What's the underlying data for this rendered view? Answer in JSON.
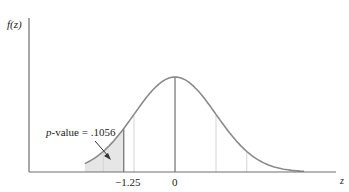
{
  "chart_data": {
    "type": "area",
    "title": "",
    "ylabel": "f(z)",
    "xlabel": "z",
    "distribution": "standard normal",
    "tick_labels": [
      "-1.25",
      "0"
    ],
    "ticks": [
      -1.25,
      0
    ],
    "shaded_region": {
      "from": "-inf",
      "to": -1.25,
      "area": 0.1056
    },
    "annotation": "p-value = .1056",
    "xlim": [
      -3,
      3
    ],
    "grid": false,
    "legend": null
  },
  "labels": {
    "y_axis": "f(z)",
    "x_axis": "z",
    "tick_neg": "−1.25",
    "tick_zero": "0",
    "pvalue_prefix": "p",
    "pvalue_rest": "-value = .1056"
  },
  "colors": {
    "curve": "#8a8a8a",
    "axis": "#6e6e6e",
    "shade": "#e6e6e6",
    "guide": "#d4d4d4",
    "text": "#222222"
  }
}
